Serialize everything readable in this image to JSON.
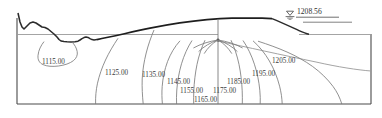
{
  "diagram": {
    "type": "dam-seepage-cross-section",
    "colors": {
      "frame": "#4a4a4a",
      "terrain_surface": "#2b2b2b",
      "dam_body": "#1e1e1e",
      "ground_line": "#9a9a9a",
      "contour_line": "#7c7c7c",
      "text": "#3c3c3c",
      "water_symbol": "#4a4a4a",
      "background": "#ffffff"
    },
    "water_level": {
      "label": "1208.56",
      "symbol": "water-level-triangle",
      "elevation": 1208.56
    },
    "contours": [
      {
        "label": "1115.00",
        "value": 1115.0,
        "x": 42,
        "y": 59
      },
      {
        "label": "1125.00",
        "value": 1125.0,
        "x": 105,
        "y": 70
      },
      {
        "label": "1135.00",
        "value": 1135.0,
        "x": 142,
        "y": 72
      },
      {
        "label": "1145.00",
        "value": 1145.0,
        "x": 167,
        "y": 79
      },
      {
        "label": "1155.00",
        "value": 1155.0,
        "x": 180,
        "y": 88
      },
      {
        "label": "1165.00",
        "value": 1165.0,
        "x": 194,
        "y": 97
      },
      {
        "label": "1175.00",
        "value": 1175.0,
        "x": 213,
        "y": 88
      },
      {
        "label": "1185.00",
        "value": 1185.0,
        "x": 227,
        "y": 79
      },
      {
        "label": "1195.00",
        "value": 1195.0,
        "x": 252,
        "y": 71
      },
      {
        "label": "1205.00",
        "value": 1205.0,
        "x": 272,
        "y": 58
      }
    ],
    "contour_interval": 10,
    "contour_range": [
      1115.0,
      1205.0
    ],
    "features": {
      "left_terrain": "natural-jagged-ground-surface",
      "dam_crest": "embankment-crest",
      "core_axis": "vertical-core-axis-line",
      "focal_point": "seepage-convergence-point",
      "downstream_slope": "downstream-face",
      "reservoir_surface": "upstream-reservoir-water-surface",
      "foundation": "foundation-rock-boundary"
    }
  }
}
